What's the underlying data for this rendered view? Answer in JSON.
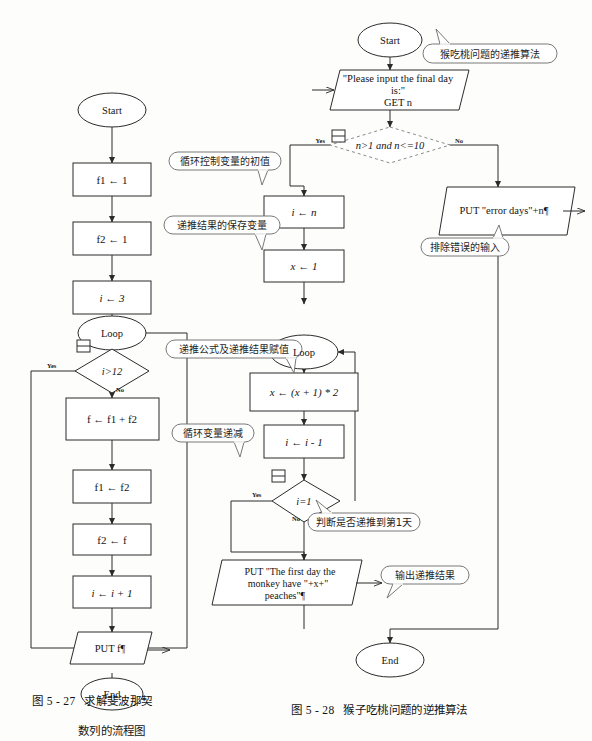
{
  "page": {
    "background": "#fdfdfb",
    "stroke": "#2b2b2b",
    "callout_stroke": "#555555",
    "dashed_stroke": "#777777"
  },
  "figure_left": {
    "caption_number": "图 5 - 27",
    "caption_line1": "求解斐波那契",
    "caption_line2": "数列的流程图",
    "nodes": [
      {
        "id": "start",
        "type": "terminator",
        "label": "Start"
      },
      {
        "id": "f1init",
        "type": "process",
        "label": "f1 ← 1"
      },
      {
        "id": "f2init",
        "type": "process",
        "label": "f2 ← 1"
      },
      {
        "id": "iinit",
        "type": "process",
        "label": "i ← 3"
      },
      {
        "id": "loop",
        "type": "terminator",
        "label": "Loop"
      },
      {
        "id": "cond",
        "type": "decision",
        "label": "i>12"
      },
      {
        "id": "sum",
        "type": "process",
        "label": "f ← f1 + f2"
      },
      {
        "id": "sh1",
        "type": "process",
        "label": "f1 ← f2"
      },
      {
        "id": "sh2",
        "type": "process",
        "label": "f2 ← f"
      },
      {
        "id": "incr",
        "type": "process",
        "label": "i ← i + 1"
      },
      {
        "id": "out",
        "type": "io",
        "label": "PUT f¶"
      },
      {
        "id": "end",
        "type": "terminator",
        "label": "End"
      }
    ],
    "branch_labels": {
      "yes": "Yes",
      "no": "No"
    }
  },
  "figure_right": {
    "caption_number": "图 5 - 28",
    "caption_line1": "猴子吃桃问题的逆推算法",
    "nodes": [
      {
        "id": "start",
        "type": "terminator",
        "label": "Start"
      },
      {
        "id": "input",
        "type": "io",
        "label_lines": [
          "\"Please input the final day",
          "is:\"",
          "GET n"
        ]
      },
      {
        "id": "cond1",
        "type": "decision",
        "label": "n>1 and n<=10",
        "dashed": true
      },
      {
        "id": "err",
        "type": "io",
        "label": "PUT \"error days\"+n¶"
      },
      {
        "id": "iinit",
        "type": "process",
        "label": "i ← n"
      },
      {
        "id": "xinit",
        "type": "process",
        "label": "x ← 1"
      },
      {
        "id": "loop",
        "type": "terminator",
        "label": "Loop"
      },
      {
        "id": "recur",
        "type": "process",
        "label": "x ← (x + 1) * 2"
      },
      {
        "id": "decr",
        "type": "process",
        "label": "i ← i - 1"
      },
      {
        "id": "cond2",
        "type": "decision",
        "label": "i=1"
      },
      {
        "id": "out",
        "type": "io",
        "label_lines": [
          "PUT \"The first day the",
          "monkey have \"+x+\"",
          "peaches\"¶"
        ]
      },
      {
        "id": "end",
        "type": "terminator",
        "label": "End"
      }
    ],
    "branch_labels": {
      "yes": "Yes",
      "no": "No"
    },
    "callouts": [
      {
        "id": "c-algo",
        "text": "猴吃桃问题的递推算法"
      },
      {
        "id": "c-initval",
        "text": "循环控制变量的初值"
      },
      {
        "id": "c-savevar",
        "text": "递推结果的保存变量"
      },
      {
        "id": "c-badinput",
        "text": "排除错误的输入"
      },
      {
        "id": "c-formula",
        "text": "递推公式及递推结果赋值"
      },
      {
        "id": "c-decr",
        "text": "循环变量递减"
      },
      {
        "id": "c-checkday",
        "text": "判断是否递推到第1天"
      },
      {
        "id": "c-output",
        "text": "输出递推结果"
      }
    ]
  }
}
